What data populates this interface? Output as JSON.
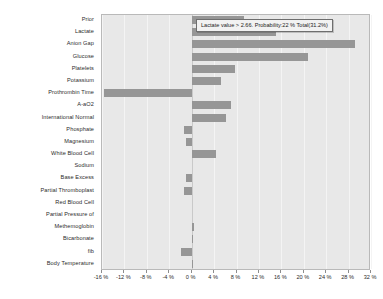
{
  "tooltip": {
    "text": "Lactate value > 2.66. Probability:22 % Total(31.2%)"
  },
  "chart_data": {
    "type": "bar",
    "orientation": "horizontal",
    "title": "",
    "xlabel": "",
    "ylabel": "",
    "grid": true,
    "legend": false,
    "xlim": [
      -16,
      32
    ],
    "xtick_step": 4,
    "xticks": [
      -16,
      -12,
      -8,
      -4,
      0,
      4,
      8,
      12,
      16,
      20,
      24,
      28,
      32
    ],
    "xtick_labels": [
      "-16 %",
      "-12 %",
      "-8 %",
      "-4 %",
      "0 %",
      "4 %",
      "8 %",
      "12 %",
      "16 %",
      "20 %",
      "24 %",
      "28 %",
      "32 %"
    ],
    "bar_color": "#969696",
    "plot_background": "#e8e8e8",
    "categories": [
      "Prior",
      "Lactate",
      "Anion Gap",
      "Glucose",
      "Platelets",
      "Potassium",
      "Prothrombin Time",
      "A-aO2",
      "International Normal",
      "Phosphate",
      "Magnesium",
      "White Blood Cell",
      "Sodium",
      "Base Excess",
      "Partial Thromboplast",
      "Red Blood Cell",
      "Partial Pressure of",
      "Methemoglobin",
      "Bicarbonate",
      "fib",
      "Body Temperature"
    ],
    "values": [
      9.4,
      15.0,
      29.2,
      20.8,
      7.8,
      5.2,
      -15.6,
      7.0,
      6.2,
      -1.3,
      -1.0,
      4.3,
      0.0,
      -1.0,
      -1.4,
      0.0,
      0.0,
      0.5,
      0.3,
      -1.9,
      0.2
    ]
  }
}
